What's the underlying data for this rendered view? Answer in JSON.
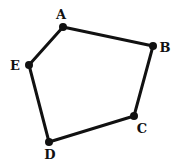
{
  "diagram": {
    "type": "polygon",
    "shape": "pentagon",
    "stroke_color": "#111111",
    "stroke_width": 3,
    "vertex_dot_radius": 4,
    "vertices": [
      {
        "label": "A",
        "x": 63,
        "y": 27,
        "label_x": 61,
        "label_y": 19
      },
      {
        "label": "B",
        "x": 153,
        "y": 46,
        "label_x": 165,
        "label_y": 52
      },
      {
        "label": "C",
        "x": 134,
        "y": 116,
        "label_x": 142,
        "label_y": 133
      },
      {
        "label": "D",
        "x": 49,
        "y": 142,
        "label_x": 50,
        "label_y": 159
      },
      {
        "label": "E",
        "x": 29,
        "y": 65,
        "label_x": 15,
        "label_y": 70
      }
    ],
    "edges": [
      [
        "A",
        "B"
      ],
      [
        "B",
        "C"
      ],
      [
        "C",
        "D"
      ],
      [
        "D",
        "E"
      ],
      [
        "E",
        "A"
      ]
    ]
  }
}
